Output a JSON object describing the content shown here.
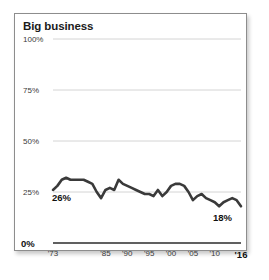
{
  "chart_data": {
    "type": "line",
    "title": "Big business",
    "xlabel": "",
    "ylabel": "",
    "ylim": [
      0,
      100
    ],
    "yticks": [
      "0%",
      "25%",
      "50%",
      "75%",
      "100%"
    ],
    "ytick_values": [
      0,
      25,
      50,
      75,
      100
    ],
    "xticks": [
      "'73",
      "'85",
      "'90",
      "'95",
      "'00",
      "'05",
      "'10",
      "'16"
    ],
    "xtick_values": [
      1973,
      1985,
      1990,
      1995,
      2000,
      2005,
      2010,
      2016
    ],
    "xlim": [
      1973,
      2016
    ],
    "grid": "horizontal",
    "legend": "none",
    "line_color": "#3a3a3a",
    "grid_color": "#cfcfcf",
    "axis_color": "#2b2b2b",
    "annotations": [
      {
        "label": "26%",
        "x": 1973,
        "y": 26
      },
      {
        "label": "18%",
        "x": 2016,
        "y": 18
      }
    ],
    "x": [
      1973,
      1974,
      1975,
      1976,
      1977,
      1978,
      1979,
      1980,
      1981,
      1982,
      1983,
      1984,
      1985,
      1986,
      1987,
      1988,
      1989,
      1990,
      1991,
      1992,
      1993,
      1994,
      1995,
      1996,
      1997,
      1998,
      1999,
      2000,
      2001,
      2002,
      2003,
      2004,
      2005,
      2006,
      2007,
      2008,
      2009,
      2010,
      2011,
      2012,
      2013,
      2014,
      2015,
      2016
    ],
    "values": [
      26,
      28,
      31,
      32,
      31,
      31,
      31,
      31,
      30,
      29,
      25,
      22,
      26,
      27,
      26,
      31,
      29,
      28,
      27,
      26,
      25,
      24,
      24,
      23,
      26,
      23,
      25,
      28,
      29,
      29,
      28,
      25,
      21,
      23,
      24,
      22,
      21,
      20,
      18,
      20,
      21,
      22,
      21,
      18
    ],
    "series": [
      {
        "name": "Big business",
        "values": [
          26,
          28,
          31,
          32,
          31,
          31,
          31,
          31,
          30,
          29,
          25,
          22,
          26,
          27,
          26,
          31,
          29,
          28,
          27,
          26,
          25,
          24,
          24,
          23,
          26,
          23,
          25,
          28,
          29,
          29,
          28,
          25,
          21,
          23,
          24,
          22,
          21,
          20,
          18,
          20,
          21,
          22,
          21,
          18
        ]
      }
    ]
  }
}
